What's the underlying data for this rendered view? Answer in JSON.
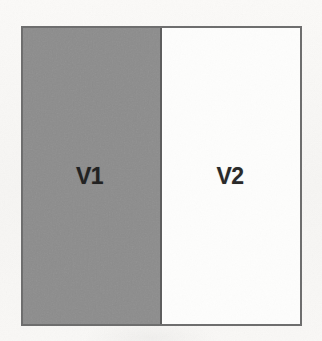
{
  "page": {
    "background_color": "#f8f7f5",
    "width": 322,
    "height": 341,
    "media": "scanned-page"
  },
  "diagram": {
    "type": "partition-rectangle",
    "title": "",
    "border_color": "#6e6e6e",
    "regions": [
      {
        "id": "v1",
        "label": "V1",
        "fill": "shaded",
        "fill_color": "#8c8c8c",
        "side": "left",
        "width_fraction": 0.5
      },
      {
        "id": "v2",
        "label": "V2",
        "fill": "unshaded",
        "fill_color": "#fdfdfc",
        "side": "right",
        "width_fraction": 0.5
      }
    ],
    "divider": {
      "orientation": "vertical",
      "color": "#5e5e5e"
    }
  }
}
